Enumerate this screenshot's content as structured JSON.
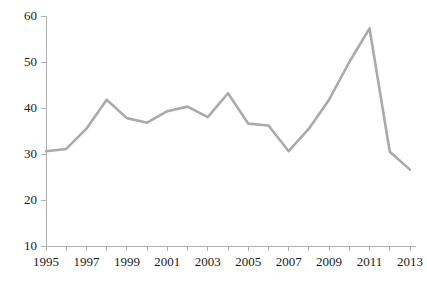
{
  "chart_data": {
    "type": "line",
    "title": "",
    "subtitle": "",
    "xlabel": "",
    "ylabel": "",
    "x": [
      1995,
      1996,
      1997,
      1998,
      1999,
      2000,
      2001,
      2002,
      2003,
      2004,
      2005,
      2006,
      2007,
      2008,
      2009,
      2010,
      2011,
      2012,
      2013
    ],
    "series": [
      {
        "name": "",
        "values": [
          30.6,
          31.1,
          35.5,
          41.8,
          37.8,
          36.8,
          39.3,
          40.3,
          38.0,
          43.2,
          36.6,
          36.2,
          30.6,
          35.5,
          41.8,
          50.0,
          57.3,
          30.5,
          26.6
        ]
      }
    ],
    "xlim": [
      1995,
      2013
    ],
    "ylim": [
      10,
      60
    ],
    "y_ticks": [
      10,
      20,
      30,
      40,
      50,
      60
    ],
    "y_tick_labels": [
      "10",
      "20",
      "30",
      "40",
      "50",
      "60"
    ],
    "x_ticks": [
      1995,
      1996,
      1997,
      1998,
      1999,
      2000,
      2001,
      2002,
      2003,
      2004,
      2005,
      2006,
      2007,
      2008,
      2009,
      2010,
      2011,
      2012,
      2013
    ],
    "x_tick_labels_shown": [
      "1995",
      "1997",
      "1999",
      "2001",
      "2003",
      "2005",
      "2007",
      "2009",
      "2011",
      "2013"
    ],
    "grid": false,
    "legend": "none",
    "annotations": [],
    "colors": {
      "line": "#aaaaaa",
      "axis": "#b0b0b0",
      "text": "#1a1a1a",
      "background": "#ffffff"
    },
    "line_width": 2.6
  }
}
